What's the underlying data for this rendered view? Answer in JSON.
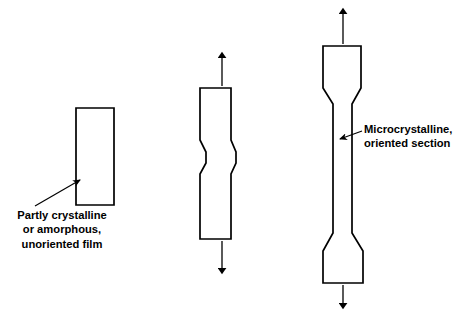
{
  "figure": {
    "domain_type": "diagram",
    "background_color": "#ffffff",
    "stroke_color": "#000000"
  },
  "annotations": {
    "left": {
      "name": "unoriented-film-label",
      "lines": [
        "Partly crystalline",
        "or amorphous,",
        "unoriented film"
      ],
      "leader": {
        "style": "diagonal-arrow",
        "from_x": 35,
        "from_y": 205,
        "to_x": 80,
        "to_y": 180,
        "points_to": "left-rectangle-specimen"
      }
    },
    "right": {
      "name": "oriented-section-label",
      "lines": [
        "Microcrystalline,",
        "oriented section"
      ],
      "leader": {
        "style": "horizontal-arrow",
        "from_x": 362,
        "from_y": 131,
        "to_x": 339,
        "to_y": 139,
        "points_to": "drawn-specimen-neck"
      }
    }
  },
  "specimens": [
    {
      "id": "specimen-unoriented",
      "name": "unoriented-film-specimen",
      "stage": 1,
      "description": "Untensioned rectangular film",
      "outline": "M 76 108 L 114 108 L 114 205 L 76 205 Z",
      "arrows": []
    },
    {
      "id": "specimen-necking",
      "name": "necking-specimen",
      "stage": 2,
      "description": "Film under tension beginning to neck",
      "outline": "M 200 88 L 231 88 L 231 140 L 236 152 L 236 163 L 231 174 L 231 239 L 200 239 L 200 174 L 206 163 L 206 152 L 200 140 Z",
      "arrows": [
        {
          "name": "tension-arrow-up",
          "direction": "up",
          "x": 222,
          "y_tail": 88,
          "y_head": 56
        },
        {
          "name": "tension-arrow-down",
          "direction": "down",
          "x": 222,
          "y_tail": 239,
          "y_head": 270
        }
      ]
    },
    {
      "id": "specimen-drawn",
      "name": "fully-drawn-specimen",
      "stage": 3,
      "description": "Fully drawn film with long oriented neck",
      "outline": "M 323 46 L 361 46 L 361 88 L 352 104 L 352 233 L 363 251 L 363 283 L 323 283 L 323 251 L 333 233 L 333 104 L 323 88 Z",
      "arrows": [
        {
          "name": "tension-arrow-up",
          "direction": "up",
          "x": 343,
          "y_tail": 46,
          "y_head": 12
        },
        {
          "name": "tension-arrow-down",
          "direction": "down",
          "x": 343,
          "y_tail": 283,
          "y_head": 305
        }
      ]
    }
  ]
}
